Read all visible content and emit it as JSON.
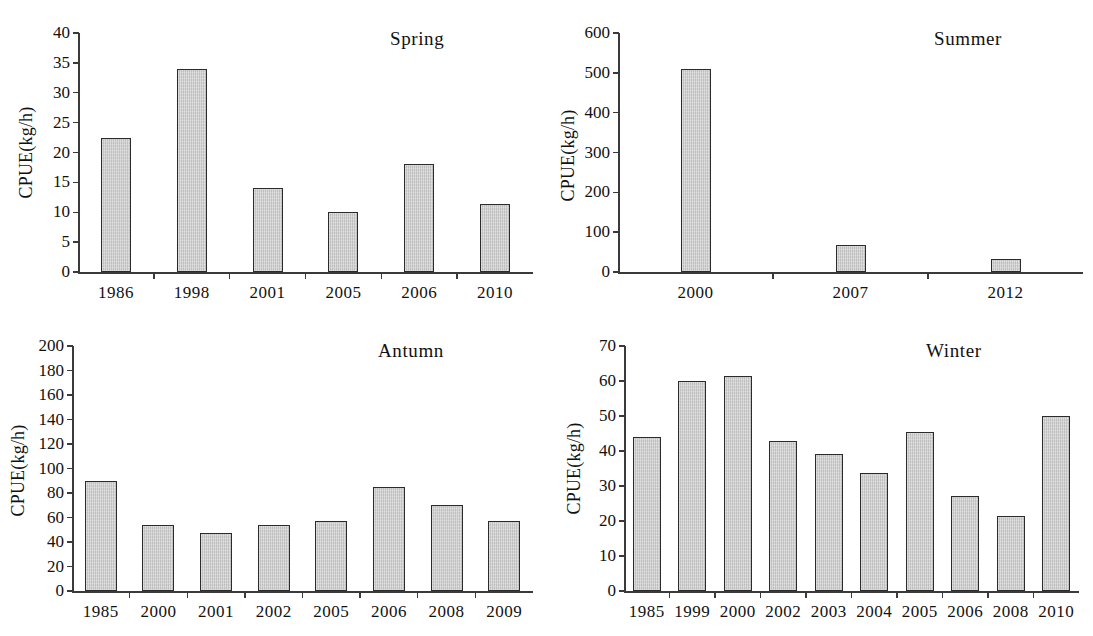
{
  "figure": {
    "background": "#ffffff",
    "bar_fill": "#c9c9c9",
    "bar_stroke": "#2b2b2b",
    "axis_color": "#3a3a3a"
  },
  "chart_data": [
    {
      "type": "bar",
      "title": "Spring",
      "xlabel": "",
      "ylabel": "CPUE(kg/h)",
      "categories": [
        "1986",
        "1998",
        "2001",
        "2005",
        "2006",
        "2010"
      ],
      "values": [
        22.4,
        34.0,
        14.1,
        10.1,
        18.1,
        11.4
      ],
      "ylim": [
        0,
        40
      ],
      "yticks": [
        0,
        5,
        10,
        15,
        20,
        25,
        30,
        35,
        40
      ],
      "grid": false,
      "legend": "none"
    },
    {
      "type": "bar",
      "title": "Summer",
      "xlabel": "",
      "ylabel": "CPUE(kg/h)",
      "categories": [
        "2000",
        "2007",
        "2012"
      ],
      "values": [
        510,
        69,
        33
      ],
      "ylim": [
        0,
        600
      ],
      "yticks": [
        0,
        100,
        200,
        300,
        400,
        500,
        600
      ],
      "grid": false,
      "legend": "none"
    },
    {
      "type": "bar",
      "title": "Antumn",
      "xlabel": "",
      "ylabel": "CPUE(kg/h)",
      "categories": [
        "1985",
        "2000",
        "2001",
        "2002",
        "2005",
        "2006",
        "2008",
        "2009"
      ],
      "values": [
        90,
        53.5,
        47.5,
        53.5,
        57.5,
        85,
        70,
        57.5
      ],
      "ylim": [
        0,
        200
      ],
      "yticks": [
        0,
        20,
        40,
        60,
        80,
        100,
        120,
        140,
        160,
        180,
        200
      ],
      "grid": false,
      "legend": "none"
    },
    {
      "type": "bar",
      "title": "Winter",
      "xlabel": "",
      "ylabel": "CPUE(kg/h)",
      "categories": [
        "1985",
        "1999",
        "2000",
        "2002",
        "2003",
        "2004",
        "2005",
        "2006",
        "2008",
        "2010"
      ],
      "values": [
        44,
        60,
        61.3,
        43,
        39.2,
        33.8,
        45.5,
        27.2,
        21.5,
        50
      ],
      "ylim": [
        0,
        70
      ],
      "yticks": [
        0,
        10,
        20,
        30,
        40,
        50,
        60,
        70
      ],
      "grid": false,
      "legend": "none"
    }
  ]
}
